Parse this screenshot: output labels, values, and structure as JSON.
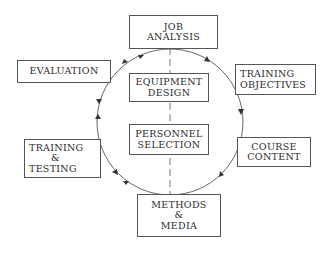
{
  "diagram": {
    "type": "cyclic-process",
    "nodes": {
      "job_analysis": {
        "lines": [
          "JOB",
          "ANALYSIS"
        ]
      },
      "training_objectives": {
        "lines": [
          "TRAINING",
          "OBJECTIVES"
        ]
      },
      "course_content": {
        "lines": [
          "COURSE",
          "CONTENT"
        ]
      },
      "methods_media": {
        "lines": [
          "METHODS",
          "&",
          "MEDIA"
        ]
      },
      "training_testing": {
        "lines": [
          "TRAINING",
          "&",
          "TESTING"
        ]
      },
      "evaluation": {
        "lines": [
          "EVALUATION"
        ]
      },
      "equipment_design": {
        "lines": [
          "EQUIPMENT",
          "DESIGN"
        ]
      },
      "personnel_selection": {
        "lines": [
          "PERSONNEL",
          "SELECTION"
        ]
      }
    },
    "cycle_order": [
      "JOB ANALYSIS",
      "TRAINING OBJECTIVES",
      "COURSE CONTENT",
      "METHODS & MEDIA",
      "TRAINING & TESTING",
      "EVALUATION",
      "JOB ANALYSIS"
    ],
    "center_axis": [
      "JOB ANALYSIS",
      "EQUIPMENT DESIGN",
      "PERSONNEL SELECTION",
      "METHODS & MEDIA"
    ],
    "colors": {
      "line": "#555555",
      "text": "#2b2b2b",
      "background": "#ffffff"
    }
  }
}
